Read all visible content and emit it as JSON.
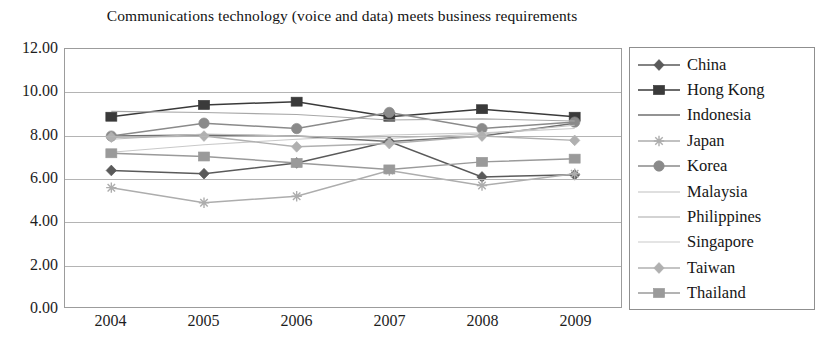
{
  "chart_data": {
    "type": "line",
    "title": "Communications technology (voice and data) meets business requirements",
    "xlabel": "",
    "ylabel": "",
    "categories": [
      "2004",
      "2005",
      "2006",
      "2007",
      "2008",
      "2009"
    ],
    "x": [
      2004,
      2005,
      2006,
      2007,
      2008,
      2009
    ],
    "ylim": [
      0.0,
      12.0
    ],
    "yticks": [
      "0.00",
      "2.00",
      "4.00",
      "6.00",
      "8.00",
      "10.00",
      "12.00"
    ],
    "ytick_values": [
      0,
      2,
      4,
      6,
      8,
      10,
      12
    ],
    "grid": true,
    "legend_position": "right",
    "series": [
      {
        "name": "China",
        "marker": "diamond",
        "color": "#5a5a5a",
        "values": [
          6.35,
          6.2,
          6.7,
          7.7,
          6.05,
          6.15
        ]
      },
      {
        "name": "Hong Kong",
        "marker": "square",
        "color": "#3a3a3a",
        "values": [
          8.85,
          9.4,
          9.55,
          8.85,
          9.2,
          8.85
        ]
      },
      {
        "name": "Indonesia",
        "marker": "line",
        "color": "#6f6f6f",
        "values": [
          7.95,
          8.0,
          7.95,
          7.7,
          7.95,
          8.55
        ]
      },
      {
        "name": "Japan",
        "marker": "star",
        "color": "#adadad",
        "values": [
          5.55,
          4.85,
          5.15,
          6.35,
          5.65,
          6.2
        ]
      },
      {
        "name": "Korea",
        "marker": "circle",
        "color": "#8a8a8a",
        "values": [
          7.95,
          8.55,
          8.3,
          9.05,
          8.3,
          8.6
        ]
      },
      {
        "name": "Malaysia",
        "marker": "none",
        "color": "#bfbfbf",
        "values": [
          7.8,
          8.05,
          7.95,
          7.85,
          8.05,
          8.45
        ]
      },
      {
        "name": "Philippines",
        "marker": "none",
        "color": "#a8a8a8",
        "values": [
          9.1,
          9.05,
          8.95,
          8.7,
          8.75,
          8.65
        ]
      },
      {
        "name": "Singapore",
        "marker": "none",
        "color": "#c9c9c9",
        "values": [
          7.2,
          7.55,
          7.8,
          8.0,
          8.1,
          8.3
        ]
      },
      {
        "name": "Taiwan",
        "marker": "diamond",
        "color": "#b0b0b0",
        "values": [
          7.9,
          7.95,
          7.45,
          7.6,
          7.95,
          7.75
        ]
      },
      {
        "name": "Thailand",
        "marker": "square",
        "color": "#9a9a9a",
        "values": [
          7.15,
          7.0,
          6.7,
          6.4,
          6.75,
          6.9
        ]
      }
    ]
  }
}
